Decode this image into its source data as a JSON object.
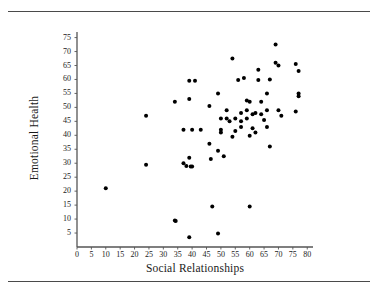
{
  "figure": {
    "has_top_rule": true,
    "has_bottom_rule": true,
    "rule_color": "#4a4a4a",
    "background": "#ffffff"
  },
  "chart_data": {
    "type": "scatter",
    "title": "",
    "xlabel": "Social Relationships",
    "ylabel": "Emotional Health",
    "xlim": [
      0,
      82
    ],
    "ylim": [
      0,
      77
    ],
    "xticks": [
      0,
      5,
      10,
      15,
      20,
      25,
      30,
      35,
      40,
      45,
      50,
      55,
      60,
      65,
      70,
      75,
      80
    ],
    "yticks": [
      5,
      10,
      15,
      20,
      25,
      30,
      35,
      40,
      45,
      50,
      55,
      60,
      65,
      70,
      75
    ],
    "xtick_labels": [
      "0",
      "5",
      "10",
      "15",
      "20",
      "25",
      "30",
      "35",
      "40",
      "45",
      "50",
      "55",
      "60",
      "65",
      "70",
      "75",
      "80"
    ],
    "ytick_labels": [
      "5",
      "10",
      "15",
      "20",
      "25",
      "30",
      "35",
      "40",
      "45",
      "50",
      "55",
      "60",
      "65",
      "70",
      "75"
    ],
    "grid": false,
    "legend": false,
    "marker": "filled-circle",
    "marker_color": "#000000",
    "marker_size": 4,
    "axis_color": "#555555",
    "n_points": 71,
    "points": [
      [
        10,
        21
      ],
      [
        24,
        47
      ],
      [
        24,
        29.5
      ],
      [
        34,
        52
      ],
      [
        34,
        9.5
      ],
      [
        34.3,
        9.3
      ],
      [
        37,
        42
      ],
      [
        37,
        30
      ],
      [
        38,
        29
      ],
      [
        39,
        59.5
      ],
      [
        39,
        53
      ],
      [
        39,
        32
      ],
      [
        39.5,
        28.8
      ],
      [
        40,
        28.8
      ],
      [
        40,
        42
      ],
      [
        41,
        59.5
      ],
      [
        39,
        3.5
      ],
      [
        46,
        50.5
      ],
      [
        46,
        37
      ],
      [
        46.5,
        31.5
      ],
      [
        47,
        14.5
      ],
      [
        49,
        34.5
      ],
      [
        49,
        55
      ],
      [
        49,
        4.8
      ],
      [
        50,
        46
      ],
      [
        50,
        42
      ],
      [
        50,
        41
      ],
      [
        51,
        32.5
      ],
      [
        52,
        46
      ],
      [
        53,
        45
      ],
      [
        54,
        39.5
      ],
      [
        54,
        67.5
      ],
      [
        55,
        46
      ],
      [
        56,
        59.8
      ],
      [
        57,
        48
      ],
      [
        57,
        45
      ],
      [
        58,
        60.5
      ],
      [
        59,
        52.5
      ],
      [
        59,
        46
      ],
      [
        59,
        49
      ],
      [
        60,
        52
      ],
      [
        60,
        14.5
      ],
      [
        60,
        39.8
      ],
      [
        61,
        47.5
      ],
      [
        61,
        42.5
      ],
      [
        62,
        41
      ],
      [
        63,
        63.5
      ],
      [
        63,
        59.8
      ],
      [
        64,
        47.5
      ],
      [
        65,
        45.5
      ],
      [
        66,
        55
      ],
      [
        66,
        49
      ],
      [
        66,
        43
      ],
      [
        67,
        36
      ],
      [
        69,
        72.5
      ],
      [
        69,
        66
      ],
      [
        70,
        65
      ],
      [
        70,
        49
      ],
      [
        76,
        65.5
      ],
      [
        76,
        48.5
      ],
      [
        77,
        63
      ],
      [
        77,
        55
      ],
      [
        77,
        54
      ],
      [
        57,
        43
      ],
      [
        52,
        49
      ],
      [
        62,
        48
      ],
      [
        55,
        41.5
      ],
      [
        43,
        42
      ],
      [
        64,
        52
      ],
      [
        67,
        60
      ],
      [
        71,
        47
      ]
    ]
  }
}
